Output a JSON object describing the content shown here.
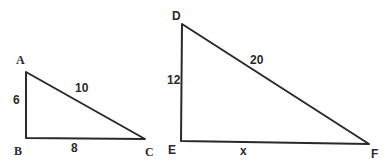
{
  "colors": {
    "line": "#2a2a2a",
    "background": "#ffffff"
  },
  "triangles": [
    {
      "name": "ABC",
      "vertices": {
        "A": {
          "label": "A",
          "x": 26,
          "y": 72
        },
        "B": {
          "label": "B",
          "x": 26,
          "y": 138
        },
        "C": {
          "label": "C",
          "x": 145,
          "y": 139
        }
      },
      "sides": {
        "AB": {
          "label": "6"
        },
        "BC": {
          "label": "8"
        },
        "AC": {
          "label": "10"
        }
      },
      "right_angle_at": "B"
    },
    {
      "name": "DEF",
      "vertices": {
        "D": {
          "label": "D",
          "x": 182,
          "y": 24
        },
        "E": {
          "label": "E",
          "x": 181,
          "y": 141
        },
        "F": {
          "label": "F",
          "x": 369,
          "y": 144
        }
      },
      "sides": {
        "DE": {
          "label": "12"
        },
        "EF": {
          "label": "x"
        },
        "DF": {
          "label": "20"
        }
      },
      "right_angle_at": "E"
    }
  ]
}
